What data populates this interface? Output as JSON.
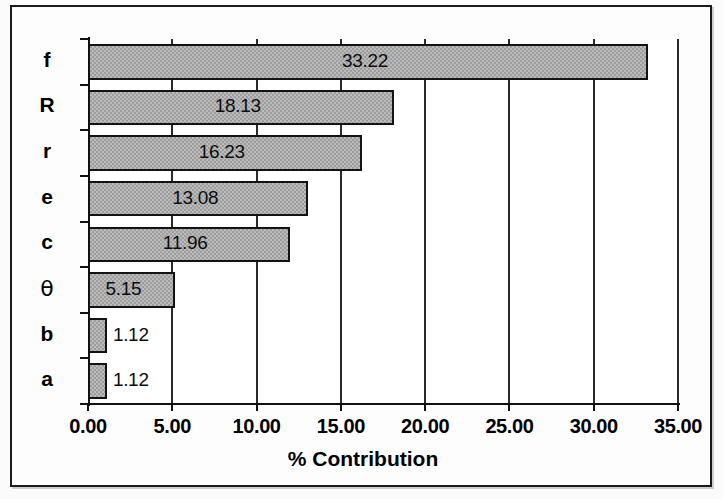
{
  "chart_data": {
    "type": "bar",
    "orientation": "horizontal",
    "title": "",
    "subtitle": "",
    "xlabel": "% Contribution",
    "ylabel": "",
    "categories": [
      "f",
      "R",
      "r",
      "e",
      "c",
      "θ",
      "b",
      "a"
    ],
    "values": [
      33.22,
      18.13,
      16.23,
      13.08,
      11.96,
      5.15,
      1.12,
      1.12
    ],
    "data_labels": [
      "33.22",
      "18.13",
      "16.23",
      "13.08",
      "11.96",
      "5.15",
      "1.12",
      "1.12"
    ],
    "xlim": [
      0,
      35
    ],
    "xticks": [
      0,
      5,
      10,
      15,
      20,
      25,
      30,
      35
    ],
    "xtick_labels": [
      "0.00",
      "5.00",
      "10.00",
      "15.00",
      "20.00",
      "25.00",
      "30.00",
      "35.00"
    ],
    "grid": true,
    "grid_axis": "x",
    "legend": "none",
    "series": [
      {
        "name": "% Contribution",
        "values": [
          33.22,
          18.13,
          16.23,
          13.08,
          11.96,
          5.15,
          1.12,
          1.12
        ]
      }
    ],
    "colors": {
      "bar_fill": "#9d9d9d",
      "bar_edge": "#131313",
      "axis": "#111111",
      "grid": "#2a2a2a",
      "text": "#000000",
      "background": "#ffffff",
      "frame": "#1b1b1b"
    }
  }
}
